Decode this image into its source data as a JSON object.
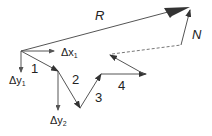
{
  "diagram": {
    "type": "vector-addition",
    "labels": {
      "resultant": "R",
      "closing": "N",
      "v1": "1",
      "v2": "2",
      "v3": "3",
      "v4": "4",
      "dx1": "Δx",
      "dx1_sub": "1",
      "dy1": "Δy",
      "dy1_sub": "1",
      "dy2": "Δy",
      "dy2_sub": "2"
    },
    "colors": {
      "line": "#555555",
      "arrowhead": "#333333"
    }
  }
}
